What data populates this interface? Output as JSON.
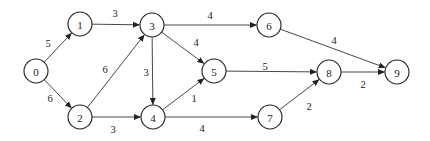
{
  "diagram": {
    "type": "directed-weighted-graph",
    "node_radius": 12,
    "nodes": [
      {
        "id": "0",
        "label": "0",
        "x": 36,
        "y": 71
      },
      {
        "id": "1",
        "label": "1",
        "x": 80,
        "y": 24
      },
      {
        "id": "2",
        "label": "2",
        "x": 80,
        "y": 117
      },
      {
        "id": "3",
        "label": "3",
        "x": 152,
        "y": 25
      },
      {
        "id": "4",
        "label": "4",
        "x": 153,
        "y": 117
      },
      {
        "id": "5",
        "label": "5",
        "x": 214,
        "y": 71
      },
      {
        "id": "6",
        "label": "6",
        "x": 269,
        "y": 25
      },
      {
        "id": "7",
        "label": "7",
        "x": 270,
        "y": 117
      },
      {
        "id": "8",
        "label": "8",
        "x": 329,
        "y": 72
      },
      {
        "id": "9",
        "label": "9",
        "x": 397,
        "y": 72
      }
    ],
    "edges": [
      {
        "from": "0",
        "to": "1",
        "weight": "5",
        "lx": 48,
        "ly": 43
      },
      {
        "from": "0",
        "to": "2",
        "weight": "6",
        "lx": 50,
        "ly": 98
      },
      {
        "from": "1",
        "to": "3",
        "weight": "3",
        "lx": 115,
        "ly": 13
      },
      {
        "from": "2",
        "to": "3",
        "weight": "6",
        "lx": 105,
        "ly": 69
      },
      {
        "from": "2",
        "to": "4",
        "weight": "3",
        "lx": 113,
        "ly": 129
      },
      {
        "from": "3",
        "to": "4",
        "weight": "3",
        "lx": 146,
        "ly": 72
      },
      {
        "from": "3",
        "to": "5",
        "weight": "4",
        "lx": 196,
        "ly": 42
      },
      {
        "from": "3",
        "to": "6",
        "weight": "4",
        "lx": 210,
        "ly": 15
      },
      {
        "from": "4",
        "to": "5",
        "weight": "1",
        "lx": 194,
        "ly": 98
      },
      {
        "from": "4",
        "to": "7",
        "weight": "4",
        "lx": 202,
        "ly": 128
      },
      {
        "from": "5",
        "to": "8",
        "weight": "5",
        "lx": 265,
        "ly": 66
      },
      {
        "from": "6",
        "to": "9",
        "weight": "4",
        "lx": 334,
        "ly": 40
      },
      {
        "from": "7",
        "to": "8",
        "weight": "2",
        "lx": 309,
        "ly": 106
      },
      {
        "from": "8",
        "to": "9",
        "weight": "2",
        "lx": 363,
        "ly": 84
      }
    ]
  }
}
